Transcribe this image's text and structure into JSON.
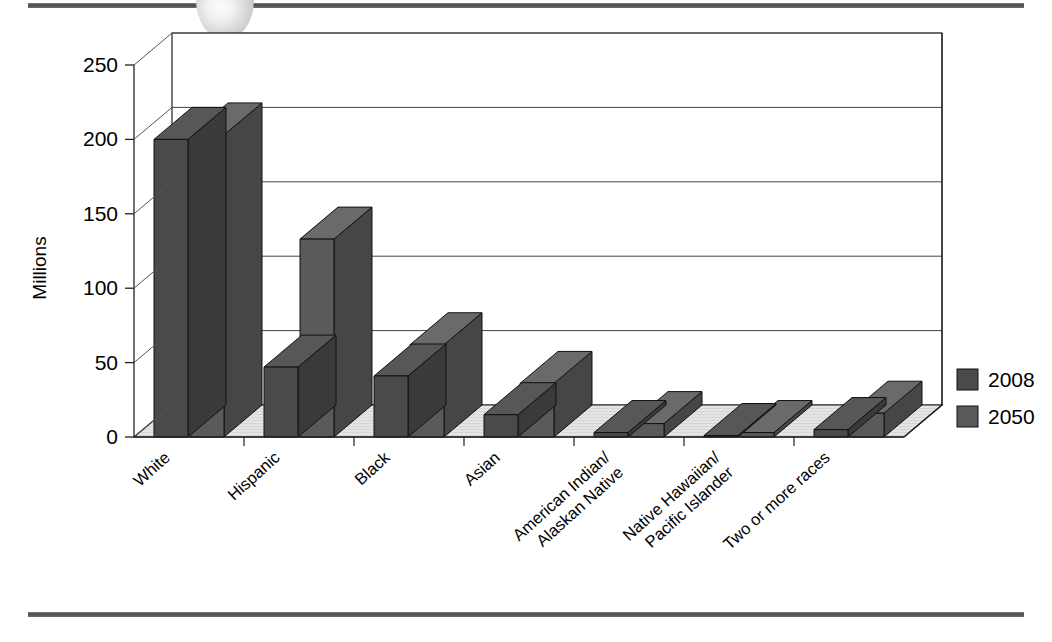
{
  "figure": {
    "kind": "3d-column-chart",
    "top_rule": "decorative-rule",
    "bottom_rule": "decorative-rule",
    "bullet_ornament": "half-circle-ornament"
  },
  "axis": {
    "y_title": "Millions",
    "y_ticks": [
      "0",
      "50",
      "100",
      "150",
      "200",
      "250"
    ]
  },
  "legend": {
    "items": [
      {
        "label": "2008",
        "color": "#4a4a4a"
      },
      {
        "label": "2050",
        "color": "#5a5a5a"
      }
    ]
  },
  "categories": [
    {
      "line1": "White",
      "line2": ""
    },
    {
      "line1": "Hispanic",
      "line2": ""
    },
    {
      "line1": "Black",
      "line2": ""
    },
    {
      "line1": "Asian",
      "line2": ""
    },
    {
      "line1": "American Indian/",
      "line2": "Alaskan Native"
    },
    {
      "line1": "Native Hawaiian/",
      "line2": "Pacific Islander"
    },
    {
      "line1": "Two or more races",
      "line2": ""
    }
  ],
  "chart_data": {
    "type": "bar",
    "title": "",
    "subtitle": "",
    "xlabel": "",
    "ylabel": "Millions",
    "ylim": [
      0,
      250
    ],
    "ytick_step": 50,
    "grid": true,
    "three_d": true,
    "legend_position": "right",
    "categories": [
      "White",
      "Hispanic",
      "Black",
      "Asian",
      "American Indian/Alaskan Native",
      "Native Hawaiian/Pacific Islander",
      "Two or more races"
    ],
    "series": [
      {
        "name": "2008",
        "color": "#4a4a4a",
        "values": [
          200,
          47,
          41,
          15,
          3,
          1,
          5
        ]
      },
      {
        "name": "2050",
        "color": "#5a5a5a",
        "values": [
          203,
          133,
          62,
          36,
          9,
          3,
          16
        ]
      }
    ],
    "units": "Millions of people"
  }
}
